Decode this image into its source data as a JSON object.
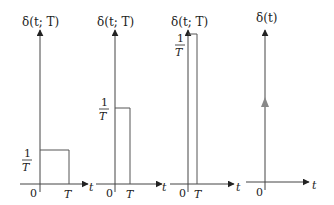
{
  "figure": {
    "panels": [
      {
        "ylabel": "δ(t; T)",
        "xlabel": "t",
        "origin_label": "0",
        "width_label": "T",
        "height_label_num": "1",
        "height_label_den": "T"
      },
      {
        "ylabel": "δ(t; T)",
        "xlabel": "t",
        "origin_label": "0",
        "width_label": "T",
        "height_label_num": "1",
        "height_label_den": "T"
      },
      {
        "ylabel": "δ(t; T)",
        "xlabel": "t",
        "origin_label": "0",
        "width_label": "T",
        "height_label_num": "1",
        "height_label_den": "T"
      },
      {
        "ylabel": "δ(t)",
        "xlabel": "t",
        "origin_label": "0"
      }
    ],
    "colors": {
      "axis": "#444444",
      "pulse": "#555555",
      "impulse_arrow": "#888888"
    }
  }
}
